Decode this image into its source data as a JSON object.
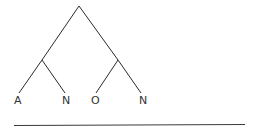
{
  "diagram": {
    "type": "syntax-tree",
    "root": {
      "children": [
        {
          "children": [
            {
              "label": "A"
            },
            {
              "label": "N"
            }
          ]
        },
        {
          "children": [
            {
              "label": "O"
            },
            {
              "label": "N"
            }
          ]
        }
      ]
    },
    "leaves": [
      "A",
      "N",
      "O",
      "N"
    ],
    "colors": {
      "line": "#2a2a2a",
      "text": "#333333",
      "background": "#ffffff"
    }
  }
}
